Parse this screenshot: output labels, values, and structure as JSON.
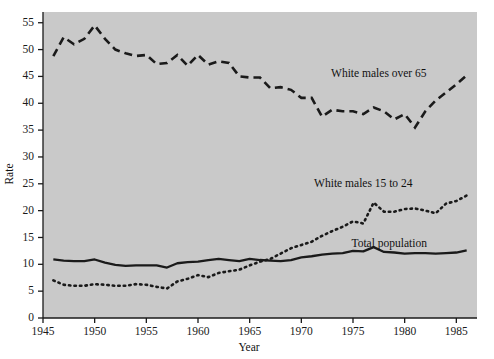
{
  "chart_data": {
    "type": "line",
    "title": "",
    "xlabel": "Year",
    "ylabel": "Rate",
    "xlim": [
      1945,
      1987
    ],
    "ylim": [
      0,
      57
    ],
    "xticks": [
      1945,
      1950,
      1955,
      1960,
      1965,
      1970,
      1975,
      1980,
      1985
    ],
    "yticks": [
      0,
      5,
      10,
      15,
      20,
      25,
      30,
      35,
      40,
      45,
      50,
      55
    ],
    "grid": false,
    "legend_position": "inline-annotations",
    "plot_background": "#c9c9c9",
    "figure_background": "#ffffff",
    "line_color": "#1a1a1a",
    "x": [
      1946,
      1947,
      1948,
      1949,
      1950,
      1951,
      1952,
      1953,
      1954,
      1955,
      1956,
      1957,
      1958,
      1959,
      1960,
      1961,
      1962,
      1963,
      1964,
      1965,
      1966,
      1967,
      1968,
      1969,
      1970,
      1971,
      1972,
      1973,
      1974,
      1975,
      1976,
      1977,
      1978,
      1979,
      1980,
      1981,
      1982,
      1983,
      1984,
      1985,
      1986
    ],
    "series": [
      {
        "name": "White males over 65",
        "style": "dashed",
        "label_x": 1977.5,
        "label_y": 45.5,
        "values": [
          48.8,
          52.3,
          51.0,
          52.0,
          54.5,
          52.0,
          50.0,
          49.3,
          48.8,
          49.0,
          47.3,
          47.5,
          49.0,
          47.0,
          49.0,
          47.2,
          47.8,
          47.5,
          45.0,
          44.8,
          44.8,
          42.8,
          43.0,
          42.5,
          41.0,
          41.0,
          37.5,
          38.8,
          38.5,
          38.5,
          38.0,
          39.2,
          38.5,
          37.0,
          38.0,
          35.5,
          38.5,
          40.5,
          42.0,
          43.5,
          45.2
        ]
      },
      {
        "name": "White males 15 to 24",
        "style": "dotted",
        "label_x": 1976.0,
        "label_y": 25.0,
        "values": [
          7.0,
          6.2,
          6.0,
          6.0,
          6.3,
          6.2,
          6.0,
          6.0,
          6.3,
          6.2,
          5.8,
          5.5,
          6.8,
          7.3,
          8.0,
          7.6,
          8.4,
          8.7,
          9.0,
          9.8,
          10.5,
          11.0,
          12.0,
          13.0,
          13.6,
          14.2,
          15.3,
          16.2,
          17.0,
          18.0,
          17.6,
          21.5,
          19.8,
          19.8,
          20.3,
          20.4,
          20.0,
          19.5,
          21.3,
          21.8,
          22.8
        ]
      },
      {
        "name": "Total population",
        "style": "solid",
        "label_x": 1978.5,
        "label_y": 13.8,
        "values": [
          10.9,
          10.7,
          10.6,
          10.6,
          10.9,
          10.3,
          9.9,
          9.7,
          9.8,
          9.8,
          9.8,
          9.4,
          10.2,
          10.4,
          10.5,
          10.8,
          11.0,
          10.8,
          10.6,
          11.0,
          10.8,
          10.7,
          10.6,
          10.8,
          11.3,
          11.5,
          11.8,
          12.0,
          12.1,
          12.5,
          12.4,
          13.2,
          12.3,
          12.2,
          12.0,
          12.1,
          12.1,
          12.0,
          12.1,
          12.2,
          12.6
        ]
      }
    ]
  },
  "axis": {
    "y_label": "Rate",
    "x_label": "Year",
    "y_tick_labels": [
      "0",
      "5",
      "10",
      "15",
      "20",
      "25",
      "30",
      "35",
      "40",
      "45",
      "50",
      "55"
    ],
    "x_tick_labels": [
      "1945",
      "1950",
      "1955",
      "1960",
      "1965",
      "1970",
      "1975",
      "1980",
      "1985"
    ]
  },
  "annotations": {
    "over65": "White males over 65",
    "age15to24": "White males 15 to 24",
    "total": "Total population"
  }
}
